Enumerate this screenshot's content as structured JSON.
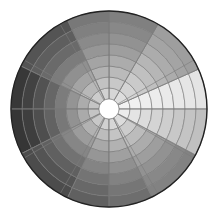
{
  "chart_data": {
    "type": "heatmap",
    "subtype": "polar-grid",
    "title": "",
    "center": [
      109,
      109
    ],
    "inner_radius": 10,
    "ring_width": 11,
    "ring_count": 8,
    "outer_radius": 98,
    "grid_color": "#7a7a7a",
    "outline_color": "#222222",
    "center_fill": "#ffffff",
    "spoke_angles_deg": [
      0,
      30,
      60,
      90,
      120,
      150,
      180,
      210,
      240,
      270,
      300,
      330
    ],
    "sectors": [
      {
        "start_deg": 0,
        "end_deg": 24,
        "values": [
          242,
          240,
          238,
          236,
          234,
          232,
          230,
          228
        ]
      },
      {
        "start_deg": 24,
        "end_deg": 60,
        "values": [
          222,
          212,
          202,
          192,
          182,
          172,
          164,
          158
        ]
      },
      {
        "start_deg": 60,
        "end_deg": 90,
        "values": [
          214,
          200,
          186,
          172,
          158,
          146,
          136,
          128
        ]
      },
      {
        "start_deg": 90,
        "end_deg": 115,
        "values": [
          210,
          194,
          178,
          164,
          150,
          138,
          128,
          120
        ]
      },
      {
        "start_deg": 115,
        "end_deg": 154,
        "values": [
          204,
          184,
          164,
          144,
          124,
          106,
          94,
          84
        ]
      },
      {
        "start_deg": 154,
        "end_deg": 180,
        "values": [
          196,
          172,
          148,
          124,
          102,
          82,
          66,
          56
        ]
      },
      {
        "start_deg": 180,
        "end_deg": 207,
        "values": [
          196,
          170,
          146,
          120,
          98,
          78,
          62,
          54
        ]
      },
      {
        "start_deg": 207,
        "end_deg": 245,
        "values": [
          200,
          178,
          156,
          134,
          114,
          96,
          84,
          76
        ]
      },
      {
        "start_deg": 245,
        "end_deg": 270,
        "values": [
          208,
          188,
          168,
          150,
          132,
          116,
          104,
          96
        ]
      },
      {
        "start_deg": 270,
        "end_deg": 296,
        "values": [
          214,
          196,
          178,
          160,
          144,
          130,
          118,
          110
        ]
      },
      {
        "start_deg": 296,
        "end_deg": 332,
        "values": [
          220,
          204,
          188,
          172,
          158,
          146,
          136,
          130
        ]
      },
      {
        "start_deg": 332,
        "end_deg": 360,
        "values": [
          236,
          228,
          220,
          212,
          206,
          200,
          196,
          192
        ]
      }
    ],
    "xlabel": "",
    "ylabel": "",
    "legend": "none",
    "grid": true
  }
}
